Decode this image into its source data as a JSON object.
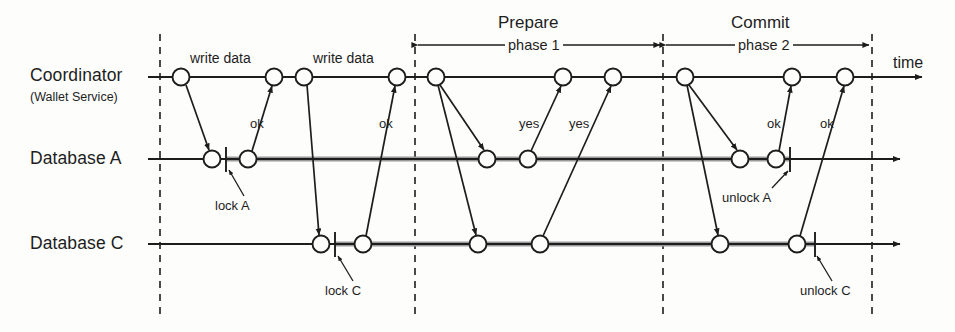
{
  "diagram": {
    "type": "sequence",
    "time_axis_label": "time",
    "lanes": [
      {
        "id": "coordinator",
        "name": "Coordinator",
        "sub": "(Wallet Service)",
        "y": 77
      },
      {
        "id": "database-a",
        "name": "Database A",
        "sub": "",
        "y": 159
      },
      {
        "id": "database-c",
        "name": "Database C",
        "sub": "",
        "y": 244
      }
    ],
    "phases": [
      {
        "id": "prepare",
        "title": "Prepare",
        "sub": "phase 1",
        "x_start": 415,
        "x_end": 663
      },
      {
        "id": "commit",
        "title": "Commit",
        "sub": "phase 2",
        "x_start": 663,
        "x_end": 872
      }
    ],
    "dividers": [
      {
        "id": "divider-start",
        "x": 160
      },
      {
        "id": "divider-phase1",
        "x": 415
      },
      {
        "id": "divider-phase2",
        "x": 663
      },
      {
        "id": "divider-end",
        "x": 872
      }
    ],
    "messages": [
      {
        "id": "write-data-a",
        "label": "write data",
        "label_x": 228,
        "label_y": 58,
        "from": "coordinator",
        "to": "database-a"
      },
      {
        "id": "ok-a-1",
        "label": "ok",
        "label_x": 258,
        "label_y": 124,
        "from": "database-a",
        "to": "coordinator"
      },
      {
        "id": "write-data-c",
        "label": "write data",
        "label_x": 350,
        "label_y": 58,
        "from": "coordinator",
        "to": "database-c"
      },
      {
        "id": "ok-c-1",
        "label": "ok",
        "label_x": 387,
        "label_y": 124,
        "from": "database-c",
        "to": "coordinator"
      },
      {
        "id": "yes-a",
        "label": "yes",
        "label_x": 531,
        "label_y": 124,
        "from": "database-a",
        "to": "coordinator"
      },
      {
        "id": "yes-c",
        "label": "yes",
        "label_x": 581,
        "label_y": 124,
        "from": "database-c",
        "to": "coordinator"
      },
      {
        "id": "ok-a-2",
        "label": "ok",
        "label_x": 775,
        "label_y": 124,
        "from": "database-a",
        "to": "coordinator"
      },
      {
        "id": "ok-c-2",
        "label": "ok",
        "label_x": 828,
        "label_y": 124,
        "from": "database-c",
        "to": "coordinator"
      }
    ],
    "annotations": [
      {
        "id": "lock-a",
        "label": "lock A",
        "label_x": 240,
        "label_y": 208,
        "tick_x": 226,
        "lane": "database-a"
      },
      {
        "id": "lock-c",
        "label": "lock C",
        "label_x": 350,
        "label_y": 293,
        "tick_x": 335,
        "lane": "database-c"
      },
      {
        "id": "unlock-a",
        "label": "unlock A",
        "label_x": 755,
        "label_y": 200,
        "tick_x": 790,
        "lane": "database-a"
      },
      {
        "id": "unlock-c",
        "label": "unlock C",
        "label_x": 838,
        "label_y": 293,
        "tick_x": 815,
        "lane": "database-c"
      }
    ],
    "events": {
      "coordinator": [
        181,
        274,
        304,
        397,
        436,
        563,
        613,
        685,
        792,
        845
      ],
      "database-a": [
        212,
        248,
        487,
        528,
        740,
        776
      ],
      "database-c": [
        321,
        363,
        478,
        540,
        720,
        797
      ]
    },
    "colors": {
      "ink": "#1d1d1d",
      "line": "#333333",
      "locked_bar": "#9a9a9a",
      "background": "#fdfdfc"
    }
  }
}
